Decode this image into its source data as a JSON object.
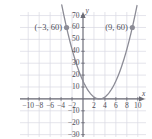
{
  "chart_data": {
    "type": "line",
    "title": "",
    "subtitle": "",
    "xlabel": "x",
    "ylabel": "y",
    "xlim": [
      -11.5,
      11.5
    ],
    "ylim": [
      -32,
      73
    ],
    "grid": true,
    "grid_spacing": {
      "x": 2,
      "y": 10
    },
    "legend": "none",
    "curve": {
      "name": "parabola",
      "description": "upward opening parabola with vertex at (3, 0)",
      "vertex": [
        3,
        0
      ],
      "equation_points": [
        [
          -3,
          60
        ],
        [
          -2,
          41.7
        ],
        [
          -1,
          26.7
        ],
        [
          0,
          15
        ],
        [
          1,
          6.7
        ],
        [
          2,
          1.7
        ],
        [
          3,
          0
        ],
        [
          4,
          1.7
        ],
        [
          5,
          6.7
        ],
        [
          6,
          15
        ],
        [
          7,
          26.7
        ],
        [
          8,
          41.7
        ],
        [
          9,
          60
        ]
      ]
    },
    "points": [
      {
        "label": "(−3, 60)",
        "x": -3,
        "y": 60,
        "label_side": "left"
      },
      {
        "label": "(9, 60)",
        "x": 9,
        "y": 60,
        "label_side": "left"
      }
    ],
    "xticks": [
      {
        "value": -10,
        "label": "−10"
      },
      {
        "value": -8,
        "label": "−8"
      },
      {
        "value": -6,
        "label": "−6"
      },
      {
        "value": -4,
        "label": "−4"
      },
      {
        "value": -2,
        "label": "−2"
      },
      {
        "value": 2,
        "label": "2"
      },
      {
        "value": 4,
        "label": "4"
      },
      {
        "value": 6,
        "label": "6"
      },
      {
        "value": 8,
        "label": "8"
      },
      {
        "value": 10,
        "label": "10"
      }
    ],
    "yticks": [
      {
        "value": 70,
        "label": "70"
      },
      {
        "value": 60,
        "label": "60"
      },
      {
        "value": 50,
        "label": "50"
      },
      {
        "value": 40,
        "label": "40"
      },
      {
        "value": 30,
        "label": "30"
      },
      {
        "value": 20,
        "label": "20"
      },
      {
        "value": 10,
        "label": "10"
      },
      {
        "value": -10,
        "label": "−10"
      },
      {
        "value": -20,
        "label": "−20"
      },
      {
        "value": -30,
        "label": "−30"
      }
    ],
    "colors": {
      "curve": "#8c8c96",
      "marker": "#8c8c96",
      "axis": "#6b6b75",
      "grid": "#d8d8e2",
      "text": "#4d4d57",
      "background": "#ffffff"
    }
  }
}
